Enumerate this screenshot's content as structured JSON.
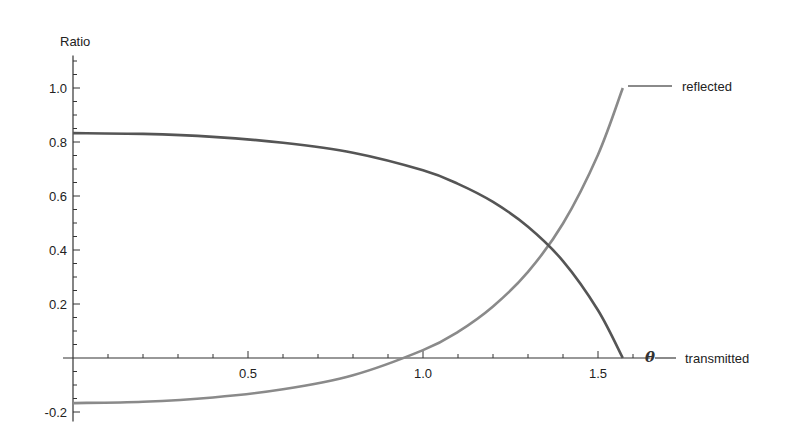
{
  "chart_data": {
    "type": "line",
    "title": "",
    "xlabel": "θ",
    "ylabel": "Ratio",
    "xlim": [
      0,
      1.65
    ],
    "ylim": [
      -0.22,
      1.12
    ],
    "x_ticks": [
      0.5,
      1.0,
      1.5
    ],
    "x_tick_labels": [
      "0.5",
      "1.0",
      "1.5"
    ],
    "x_minor_step": 0.1,
    "y_ticks": [
      -0.2,
      0.2,
      0.4,
      0.6,
      0.8,
      1.0
    ],
    "y_tick_labels": [
      "-0.2",
      "0.2",
      "0.4",
      "0.6",
      "0.8",
      "1.0"
    ],
    "y_minor_step": 0.05,
    "grid": false,
    "legend_position": "inline-right",
    "x": [
      0,
      0.2,
      0.4,
      0.6,
      0.8,
      1.0,
      1.1,
      1.2,
      1.3,
      1.4,
      1.5,
      1.5708
    ],
    "series": [
      {
        "name": "reflected",
        "color": "#8a8a8a",
        "values": [
          -0.167,
          -0.162,
          -0.146,
          -0.116,
          -0.064,
          0.029,
          0.097,
          0.191,
          0.319,
          0.498,
          0.753,
          1.0
        ]
      },
      {
        "name": "transmitted",
        "color": "#555555",
        "values": [
          0.833,
          0.83,
          0.819,
          0.797,
          0.76,
          0.695,
          0.645,
          0.578,
          0.486,
          0.359,
          0.177,
          0.0
        ]
      }
    ]
  },
  "labels": {
    "y_axis_title": "Ratio",
    "x_axis_variable": "θ",
    "legend_reflected": "reflected",
    "legend_transmitted": "transmitted"
  }
}
